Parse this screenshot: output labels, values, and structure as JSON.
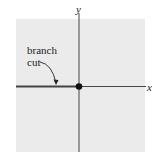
{
  "diagram": {
    "type": "complex-plane",
    "axes": {
      "x_label": "x",
      "y_label": "y"
    },
    "annotation": {
      "line1": "branch",
      "line2": "cut"
    },
    "origin_point": "origin-dot",
    "colors": {
      "plane_fill": "#ebebeb",
      "axis": "#333333",
      "branch_cut": "#444444",
      "dot": "#111111",
      "text": "#222222"
    }
  }
}
